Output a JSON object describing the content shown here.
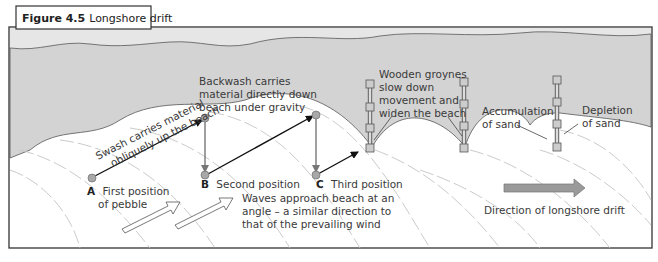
{
  "figure": {
    "number": "Figure 4.5",
    "title": "Longshore drift"
  },
  "labels": {
    "swash_line1": "Swash carries material",
    "swash_line2": "obliquely up the beach",
    "backwash_line1": "Backwash carries",
    "backwash_line2": "material directly down",
    "backwash_line3": "beach under gravity",
    "groynes_line1": "Wooden groynes",
    "groynes_line2": "slow down",
    "groynes_line3": "movement and",
    "groynes_line4": "widen the beach",
    "accumulation_line1": "Accumulation",
    "accumulation_line2": "of sand",
    "depletion_line1": "Depletion",
    "depletion_line2": "of sand",
    "waves_line1": "Waves approach beach at an",
    "waves_line2": "angle – a similar direction to",
    "waves_line3": "that of the prevailing wind",
    "drift_direction": "Direction of longshore drift"
  },
  "positions": [
    {
      "letter": "A",
      "line1": "First position",
      "line2": "of pebble"
    },
    {
      "letter": "B",
      "line1": "Second position",
      "line2": ""
    },
    {
      "letter": "C",
      "line1": "Third position",
      "line2": ""
    }
  ],
  "colors": {
    "sea": "#d2d2d2",
    "sea_far": "#e4e4e4",
    "beach": "#ffffff",
    "pebble": "#a8a8a8",
    "drift_arrow": "#9a9a9a",
    "outline": "#333333"
  }
}
